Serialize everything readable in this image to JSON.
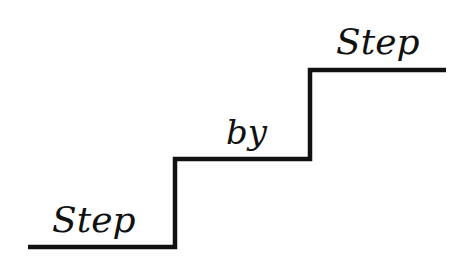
{
  "words": {
    "first": "Step",
    "second": "by",
    "third": "Step"
  },
  "colors": {
    "background": "#ffffff",
    "ink": "#111111"
  }
}
